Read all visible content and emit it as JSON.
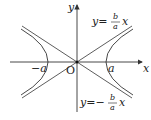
{
  "diagram": {
    "type": "hyperbola with asymptotes",
    "axes": {
      "x_label": "x",
      "y_label": "y",
      "origin_label": "O"
    },
    "vertices": {
      "left_label": "−a",
      "right_label": "a"
    },
    "asymptotes": {
      "upper": {
        "prefix": "y=",
        "num": "b",
        "den": "a",
        "var": "x"
      },
      "lower": {
        "prefix": "y=−",
        "num": "b",
        "den": "a",
        "var": "x"
      }
    }
  }
}
